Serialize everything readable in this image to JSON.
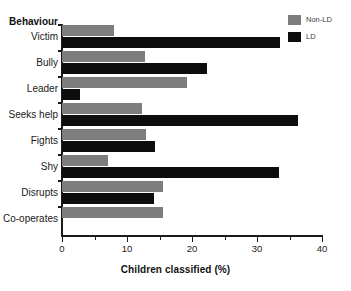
{
  "chart_data": {
    "type": "bar",
    "orientation": "horizontal",
    "title": "",
    "xlabel": "Children classified (%)",
    "ylabel": "Behaviour",
    "categories": [
      "Victim",
      "Bully",
      "Leader",
      "Seeks help",
      "Fights",
      "Shy",
      "Disrupts",
      "Co-operates"
    ],
    "series": [
      {
        "name": "Non-LD",
        "color": "#7d7d7d",
        "values": [
          8.0,
          12.8,
          19.3,
          12.3,
          12.9,
          7.1,
          15.6,
          15.6
        ]
      },
      {
        "name": "LD",
        "color": "#0d0d0d",
        "values": [
          33.5,
          22.3,
          2.8,
          36.3,
          14.3,
          33.4,
          14.2,
          null
        ]
      }
    ],
    "xlim": [
      0,
      40
    ],
    "xticks": [
      0,
      10,
      20,
      30,
      40
    ],
    "xtick_labels": [
      "0",
      "10",
      "20",
      "30",
      "40"
    ],
    "xminor_ticks": [
      5,
      15,
      25,
      35
    ],
    "grid": false,
    "legend_position": "top-right"
  },
  "legend": {
    "entries": [
      {
        "label": "Non-LD",
        "color": "#7d7d7d"
      },
      {
        "label": "LD",
        "color": "#0d0d0d"
      }
    ]
  },
  "axes": {
    "y_header": "Behaviour",
    "x_title": "Children classified (%)"
  }
}
